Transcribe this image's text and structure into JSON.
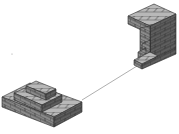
{
  "scene": {
    "description": "Isometric brick structures connected by a thin line",
    "colors": {
      "background": "#ffffff",
      "brick_top": "#b8b8b8",
      "brick_left": "#8a8a8a",
      "brick_right": "#5e5e5e",
      "mortar": "#2a2a2a",
      "connector": "#9a9a9a"
    },
    "objects": [
      {
        "name": "stepped-brick-corner-lower-left"
      },
      {
        "name": "stepped-brick-wall-upper-right"
      },
      {
        "name": "connector-line"
      }
    ]
  }
}
